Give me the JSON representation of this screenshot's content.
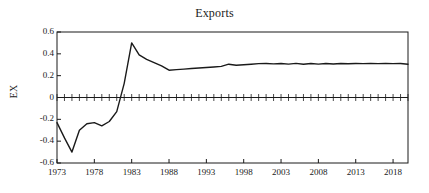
{
  "chart_data": {
    "type": "line",
    "title": "Exports",
    "xlabel": "",
    "ylabel": "EX",
    "xlim": [
      1973,
      2020
    ],
    "ylim": [
      -0.6,
      0.6
    ],
    "grid": false,
    "legend": "none",
    "x_ticks": [
      "1973",
      "1978",
      "1983",
      "1988",
      "1993",
      "1998",
      "2003",
      "2008",
      "2013",
      "2018"
    ],
    "x_tick_values": [
      1973,
      1978,
      1983,
      1988,
      1993,
      1998,
      2003,
      2008,
      2013,
      2018
    ],
    "y_ticks": [
      "0.6",
      "0.4",
      "0.2",
      "0",
      "-0.2",
      "-0.4",
      "-0.6"
    ],
    "y_tick_values": [
      0.6,
      0.4,
      0.2,
      0,
      -0.2,
      -0.4,
      -0.6
    ],
    "minor_x_ticks_interval": 1,
    "line_color": "#1a1a1a",
    "series": [
      {
        "name": "EX",
        "x": [
          1973,
          1974,
          1975,
          1976,
          1977,
          1978,
          1979,
          1980,
          1981,
          1982,
          1983,
          1984,
          1985,
          1986,
          1987,
          1988,
          1989,
          1990,
          1991,
          1992,
          1993,
          1994,
          1995,
          1996,
          1997,
          1998,
          1999,
          2000,
          2001,
          2002,
          2003,
          2004,
          2005,
          2006,
          2007,
          2008,
          2009,
          2010,
          2011,
          2012,
          2013,
          2014,
          2015,
          2016,
          2017,
          2018,
          2019,
          2020
        ],
        "values": [
          -0.23,
          -0.37,
          -0.5,
          -0.3,
          -0.24,
          -0.23,
          -0.26,
          -0.22,
          -0.13,
          0.13,
          0.5,
          0.39,
          0.35,
          0.32,
          0.29,
          0.25,
          0.255,
          0.26,
          0.265,
          0.27,
          0.275,
          0.28,
          0.285,
          0.305,
          0.295,
          0.3,
          0.305,
          0.31,
          0.312,
          0.308,
          0.312,
          0.306,
          0.313,
          0.305,
          0.312,
          0.306,
          0.312,
          0.307,
          0.312,
          0.309,
          0.311,
          0.31,
          0.311,
          0.31,
          0.311,
          0.31,
          0.311,
          0.305
        ]
      }
    ]
  },
  "axes": {
    "frame_color": "#1a1a1a",
    "zero_line_label": "0"
  }
}
